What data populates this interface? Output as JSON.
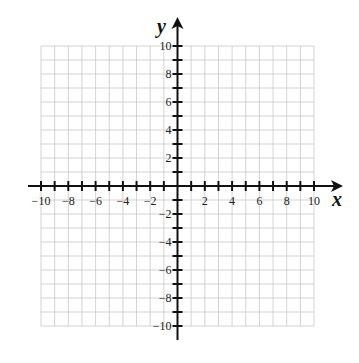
{
  "chart_data": {
    "type": "scatter",
    "title": "",
    "xlabel": "x",
    "ylabel": "y",
    "xlim": [
      -10,
      10
    ],
    "ylim": [
      -10,
      10
    ],
    "grid": true,
    "grid_step": 1,
    "x_tick_labels": [
      "-10",
      "-8",
      "-6",
      "-4",
      "-2",
      "2",
      "4",
      "6",
      "8",
      "10"
    ],
    "y_tick_labels": [
      "10",
      "8",
      "6",
      "4",
      "2",
      "-2",
      "-4",
      "-6",
      "-8",
      "-10"
    ],
    "series": [],
    "legend": null
  },
  "colors": {
    "grid": "#c8c8c8",
    "axis": "#111111",
    "text": "#222222"
  }
}
